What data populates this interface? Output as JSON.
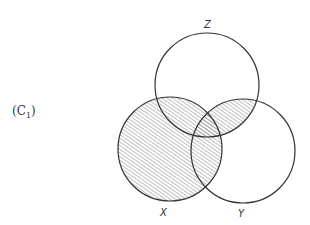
{
  "panel_label": {
    "prefix": "(C",
    "sub": "1",
    "suffix": ")"
  },
  "diagram": {
    "type": "venn-3",
    "shaded_region": "X ∪ (Y ∩ Z)",
    "sets": [
      {
        "name": "Z",
        "label": "Z",
        "cx": 207,
        "cy": 85,
        "r": 52
      },
      {
        "name": "X",
        "label": "X",
        "cx": 170,
        "cy": 149,
        "r": 52
      },
      {
        "name": "Y",
        "label": "Y",
        "cx": 243,
        "cy": 151,
        "r": 52
      }
    ],
    "colors": {
      "stroke": "#333333",
      "hatch": "#8a8a8a",
      "background": "#ffffff"
    }
  }
}
